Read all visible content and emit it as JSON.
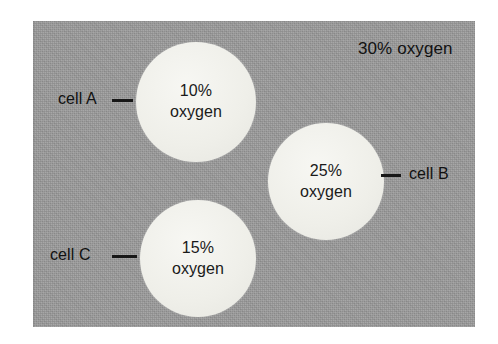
{
  "figure": {
    "name": "oxygen-concentration-cells-diagram",
    "medium": {
      "label": "30% oxygen",
      "concentration_percent": 30,
      "color": "#9a9a9a"
    },
    "cells": [
      {
        "id": "cell-a",
        "label": "cell A",
        "value_line1": "10%",
        "value_line2": "oxygen",
        "concentration_percent": 10,
        "leader_side": "left",
        "color": "#efefe9"
      },
      {
        "id": "cell-b",
        "label": "cell B",
        "value_line1": "25%",
        "value_line2": "oxygen",
        "concentration_percent": 25,
        "leader_side": "right",
        "color": "#efefe9"
      },
      {
        "id": "cell-c",
        "label": "cell C",
        "value_line1": "15%",
        "value_line2": "oxygen",
        "concentration_percent": 15,
        "leader_side": "left",
        "color": "#efefe9"
      }
    ]
  },
  "chart_data": {
    "type": "bar",
    "title": "",
    "xlabel": "",
    "ylabel": "",
    "categories": [
      "cell A",
      "cell C",
      "cell B",
      "medium"
    ],
    "values": [
      10,
      15,
      25,
      30
    ],
    "ylim": [
      0,
      30
    ]
  }
}
